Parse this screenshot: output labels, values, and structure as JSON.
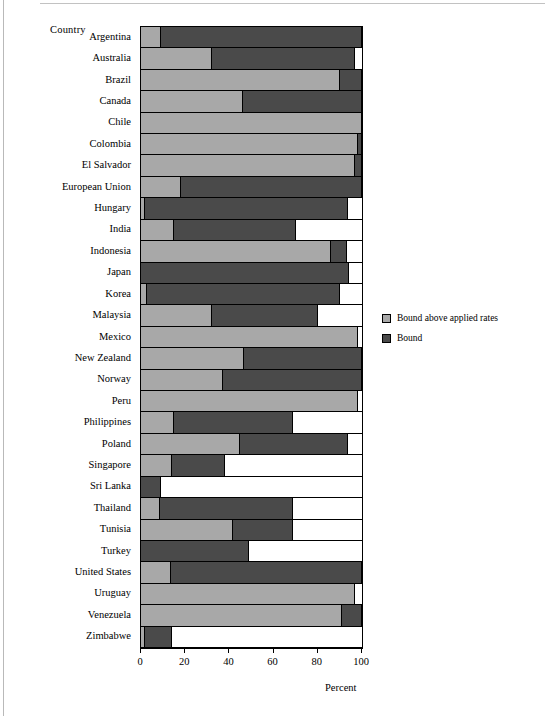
{
  "chart_data": {
    "type": "bar",
    "orientation": "horizontal",
    "stacked": true,
    "title": "",
    "xlabel": "Percent",
    "ylabel": "Country",
    "xlim": [
      0,
      100
    ],
    "xticks": [
      0,
      20,
      40,
      60,
      80,
      100
    ],
    "grid": false,
    "legend_position": "right",
    "colors": {
      "bound_above_applied": "#a8a8a8",
      "bound": "#4a4a4a"
    },
    "categories": [
      "Argentina",
      "Australia",
      "Brazil",
      "Canada",
      "Chile",
      "Colombia",
      "El Salvador",
      "European Union",
      "Hungary",
      "India",
      "Indonesia",
      "Japan",
      "Korea",
      "Malaysia",
      "Mexico",
      "New Zealand",
      "Norway",
      "Peru",
      "Philippines",
      "Poland",
      "Singapore",
      "Sri Lanka",
      "Thailand",
      "Tunisia",
      "Turkey",
      "United States",
      "Uruguay",
      "Venezuela",
      "Zimbabwe"
    ],
    "series": [
      {
        "name": "Bound above applied rates",
        "values": [
          9,
          32,
          90,
          46,
          100,
          98,
          97,
          18,
          2,
          15,
          86,
          0,
          2.5,
          32,
          98,
          46.5,
          37,
          98,
          15,
          45,
          14,
          0,
          8.5,
          41.5,
          0,
          13.5,
          97,
          91,
          2
        ]
      },
      {
        "name": "Bound",
        "values": [
          91,
          65,
          10,
          54,
          0,
          2,
          3,
          82,
          91.5,
          55,
          7,
          94,
          87.5,
          48,
          0,
          53.5,
          63,
          0,
          54,
          48.5,
          24,
          9,
          60.5,
          27.5,
          49,
          86.5,
          0,
          9,
          12
        ]
      }
    ],
    "series_totals": [
      100,
      97,
      100,
      100,
      100,
      100,
      100,
      100,
      93.5,
      70,
      93,
      94,
      90,
      80,
      98,
      100,
      100,
      98,
      69,
      93.5,
      38,
      9,
      69,
      69,
      49,
      100,
      97,
      100,
      14
    ]
  },
  "legend": {
    "items": [
      {
        "label": "Bound above applied rates",
        "color": "#a8a8a8"
      },
      {
        "label": "Bound",
        "color": "#4a4a4a"
      }
    ]
  },
  "axes": {
    "y_title": "Country",
    "x_title": "Percent",
    "x_tick_labels": [
      "0",
      "20",
      "40",
      "60",
      "80",
      "100"
    ]
  }
}
